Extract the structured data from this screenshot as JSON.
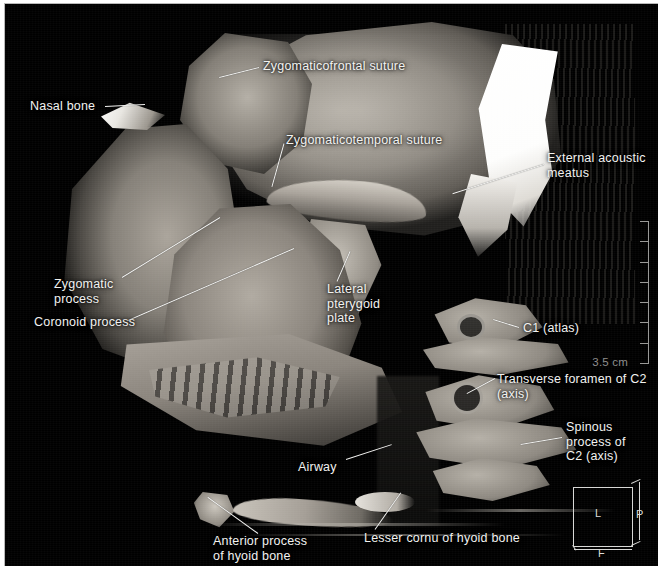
{
  "viewer": {
    "title": "3D CT volume rendering - lateral skull and cervical spine",
    "modality": "CT volume rendering",
    "background_color": "#000000",
    "label_color": "#f2f2f0"
  },
  "annotations": [
    {
      "id": "zygomaticofrontal-suture",
      "text": "Zygomaticofrontal suture",
      "align": "left",
      "x": 262,
      "y": 58,
      "leader": {
        "x1": 258,
        "y1": 66,
        "x2": 218,
        "y2": 76
      }
    },
    {
      "id": "nasal-bone",
      "text": "Nasal bone",
      "align": "left",
      "x": 29,
      "y": 98,
      "leader": {
        "x1": 104,
        "y1": 105,
        "x2": 144,
        "y2": 103
      }
    },
    {
      "id": "zygomaticotemporal-suture",
      "text": "Zygomaticotemporal suture",
      "align": "left",
      "x": 285,
      "y": 132,
      "leader": {
        "x1": 283,
        "y1": 142,
        "x2": 271,
        "y2": 185
      }
    },
    {
      "id": "external-acoustic-meatus",
      "text": "External acoustic\nmeatus",
      "align": "left",
      "x": 546,
      "y": 150,
      "leader": {
        "x1": 543,
        "y1": 163,
        "x2": 452,
        "y2": 192
      }
    },
    {
      "id": "zygomatic-process",
      "text": "Zygomatic\nprocess",
      "align": "left",
      "x": 53,
      "y": 276,
      "leader": {
        "x1": 121,
        "y1": 276,
        "x2": 219,
        "y2": 216
      }
    },
    {
      "id": "coronoid-process",
      "text": "Coronoid process",
      "align": "left",
      "x": 33,
      "y": 314,
      "leader": {
        "x1": 127,
        "y1": 319,
        "x2": 293,
        "y2": 247
      }
    },
    {
      "id": "lateral-pterygoid-plate",
      "text": "Lateral\npterygoid\nplate",
      "align": "left",
      "x": 326,
      "y": 281,
      "leader": {
        "x1": 336,
        "y1": 280,
        "x2": 349,
        "y2": 250
      }
    },
    {
      "id": "c1-atlas",
      "text": "C1  (atlas)",
      "align": "left",
      "x": 522,
      "y": 320,
      "leader": {
        "x1": 518,
        "y1": 326,
        "x2": 492,
        "y2": 318
      }
    },
    {
      "id": "transverse-foramen-c2",
      "text": "Transverse foramen of C2 (axis)",
      "align": "left",
      "x": 496,
      "y": 371,
      "leader": {
        "x1": 494,
        "y1": 377,
        "x2": 466,
        "y2": 392
      }
    },
    {
      "id": "spinous-process-c2",
      "text": "Spinous\nprocess of\nC2 (axis)",
      "align": "left",
      "x": 565,
      "y": 419,
      "leader": {
        "x1": 561,
        "y1": 436,
        "x2": 520,
        "y2": 443
      }
    },
    {
      "id": "airway",
      "text": "Airway",
      "align": "left",
      "x": 297,
      "y": 459,
      "leader": {
        "x1": 345,
        "y1": 458,
        "x2": 391,
        "y2": 443
      }
    },
    {
      "id": "anterior-process-hyoid",
      "text": "Anterior process\nof hyoid bone",
      "align": "left",
      "x": 212,
      "y": 533,
      "leader": {
        "x1": 257,
        "y1": 532,
        "x2": 207,
        "y2": 496
      }
    },
    {
      "id": "lesser-cornu-hyoid",
      "text": "Lesser cornu of hyoid bone",
      "align": "left",
      "x": 363,
      "y": 530,
      "leader": {
        "x1": 374,
        "y1": 528,
        "x2": 400,
        "y2": 491
      }
    }
  ],
  "scale_ruler": {
    "label": "3.5 cm",
    "tick_count": 8,
    "color": "#9a9a98"
  },
  "orientation_cube": {
    "left_label": "L",
    "posterior_label": "P",
    "foot_label": "F"
  }
}
